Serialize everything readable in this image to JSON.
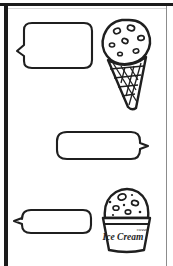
{
  "page": {
    "style": "black-and-white line drawing",
    "background_color": "#ffffff",
    "ink_color": "#1b1b1b",
    "frame": {
      "spine_side": "left",
      "spine_color": "#1b1b1b",
      "edge_color": "#8c8c8c"
    }
  },
  "speech_bubbles": [
    {
      "index": 1,
      "name": "speech-bubble-top-left",
      "text": "",
      "placeholder": "",
      "tail_side": "left",
      "shape": "rounded-rectangle",
      "x": 16,
      "y": 22,
      "width": 76,
      "height": 46
    },
    {
      "index": 2,
      "name": "speech-bubble-middle-right",
      "text": "",
      "placeholder": "",
      "tail_side": "right",
      "shape": "rounded-rectangle",
      "x": 55,
      "y": 130,
      "width": 88,
      "height": 28
    },
    {
      "index": 3,
      "name": "speech-bubble-bottom-left",
      "text": "",
      "placeholder": "",
      "tail_side": "left",
      "shape": "rounded-rectangle",
      "x": 16,
      "y": 208,
      "width": 76,
      "height": 24
    }
  ],
  "illustrations": [
    {
      "index": 1,
      "name": "ice-cream-cone-illustration",
      "subject": "ice cream cone",
      "details": "single scoop with chocolate chips on a waffle cone",
      "label": "",
      "x": 98,
      "y": 18,
      "width": 58,
      "height": 92
    },
    {
      "index": 2,
      "name": "ice-cream-cup-illustration",
      "subject": "ice cream cup",
      "details": "domed scoop with chocolate chips in a paper cup",
      "label": "Ice Cream",
      "label_small": "sweet",
      "x": 98,
      "y": 188,
      "width": 58,
      "height": 64
    }
  ]
}
